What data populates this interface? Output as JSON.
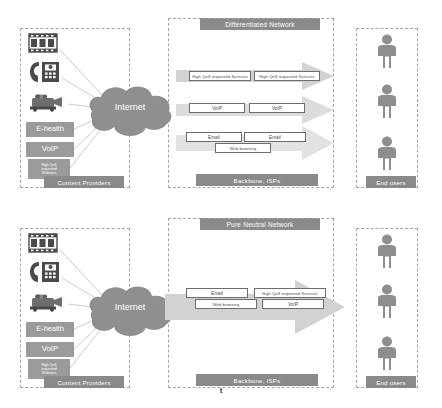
{
  "figure": {
    "axis_label": "t"
  },
  "panels": [
    {
      "id": "differentiated",
      "title": "Differentiated Network",
      "left_group": {
        "caption": "Content Providers",
        "icons": [
          {
            "name": "film-strip-icon"
          },
          {
            "name": "fax-phone-icon"
          },
          {
            "name": "video-camera-icon"
          }
        ],
        "services": [
          {
            "label": "E-health"
          },
          {
            "label": "VoIP"
          },
          {
            "label": "High QoS requested Websites",
            "lines": [
              "High QoS",
              "requested",
              "Websites"
            ]
          }
        ]
      },
      "cloud": {
        "label": "Internet"
      },
      "middle_group": {
        "caption": "Backbone, ISPs",
        "lanes": [
          {
            "name": "lane-high-qos",
            "boxes": [
              {
                "label": "High QoS requested Services"
              },
              {
                "label": "High QoS requested Services"
              }
            ]
          },
          {
            "name": "lane-voip",
            "boxes": [
              {
                "label": "VoIP"
              },
              {
                "label": "VoIP"
              }
            ]
          },
          {
            "name": "lane-besteffort",
            "boxes": [
              {
                "label": "Email"
              },
              {
                "label": "Email"
              },
              {
                "label": "Web browsing"
              }
            ]
          }
        ]
      },
      "right_group": {
        "caption": "End users",
        "people": 3
      }
    },
    {
      "id": "pure-neutral",
      "title": "Pure Neutral Network",
      "left_group": {
        "caption": "Content Providers",
        "icons": [
          {
            "name": "film-strip-icon"
          },
          {
            "name": "fax-phone-icon"
          },
          {
            "name": "video-camera-icon"
          }
        ],
        "services": [
          {
            "label": "E-health"
          },
          {
            "label": "VoIP"
          },
          {
            "label": "High QoS requested Websites",
            "lines": [
              "High QoS",
              "requested",
              "Websites"
            ]
          }
        ]
      },
      "cloud": {
        "label": "Internet"
      },
      "middle_group": {
        "caption": "Backbone, ISPs",
        "lanes": [
          {
            "name": "lane-single",
            "boxes": [
              {
                "label": "Email"
              },
              {
                "label": "High QoS requested Services"
              },
              {
                "label": "Web browsing"
              },
              {
                "label": "VoIP"
              }
            ]
          }
        ]
      },
      "right_group": {
        "caption": "End users",
        "people": 3
      }
    }
  ],
  "colors": {
    "caption_bar": "#8a8a8a",
    "service_box": "#9b9b9b",
    "cloud": "#8f8f8f",
    "arrow_light": "#d9d9d9",
    "arrow_mid": "#cfcfcf",
    "dashed_border": "#9aa6b4",
    "person": "#8e8e8e"
  }
}
